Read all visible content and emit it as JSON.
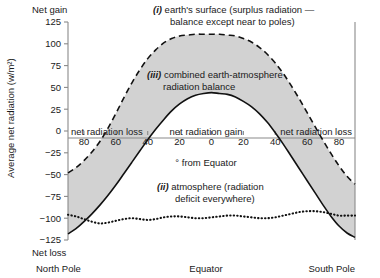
{
  "chart_data": {
    "type": "line",
    "title": "",
    "xlabel": "° from Equator",
    "ylabel": "Average net radiation (w/m²)",
    "ylim": [
      -125,
      125
    ],
    "yticks": [
      125,
      100,
      75,
      50,
      25,
      0,
      -25,
      -50,
      -75,
      -100,
      -125
    ],
    "ytick_labels": [
      "125",
      "100",
      "75",
      "50",
      "25",
      "0",
      "−25",
      "−50",
      "−75",
      "−100",
      "−125"
    ],
    "xlim": [
      -90,
      90
    ],
    "xticks": [
      -80,
      -60,
      -40,
      -20,
      0,
      20,
      40,
      60,
      80
    ],
    "xtick_labels": [
      "80",
      "60",
      "40",
      "20",
      "0",
      "20",
      "40",
      "60",
      "80"
    ],
    "x_left_end_label": "North Pole",
    "x_center_label": "Equator",
    "x_right_end_label": "South Pole",
    "y_top_label": "Net gain",
    "y_bottom_label": "Net loss",
    "grid": false,
    "legend_position": "inline-annotations",
    "x": [
      -90,
      -85,
      -80,
      -75,
      -70,
      -65,
      -60,
      -55,
      -50,
      -45,
      -40,
      -35,
      -30,
      -25,
      -20,
      -15,
      -10,
      -5,
      0,
      5,
      10,
      15,
      20,
      25,
      30,
      35,
      40,
      45,
      50,
      55,
      60,
      65,
      70,
      75,
      80,
      85,
      90
    ],
    "series": [
      {
        "name": "earth's surface",
        "key": "i",
        "style": "dashed",
        "values": [
          -48,
          -42,
          -34,
          -24,
          -12,
          3,
          20,
          38,
          55,
          70,
          83,
          93,
          101,
          106,
          109,
          110,
          111,
          111,
          111,
          111,
          110,
          109,
          106,
          102,
          96,
          88,
          78,
          66,
          52,
          37,
          21,
          5,
          -11,
          -26,
          -40,
          -52,
          -61
        ]
      },
      {
        "name": "combined earth-atmosphere radiation balance",
        "key": "iii",
        "style": "solid",
        "values": [
          -118,
          -112,
          -104,
          -95,
          -85,
          -74,
          -62,
          -49,
          -36,
          -23,
          -10,
          2,
          13,
          23,
          31,
          37,
          41,
          43,
          44,
          43,
          42,
          39,
          34,
          28,
          20,
          10,
          -2,
          -15,
          -29,
          -43,
          -57,
          -71,
          -85,
          -98,
          -109,
          -117,
          -122
        ]
      },
      {
        "name": "atmosphere (radiation deficit everywhere)",
        "key": "ii",
        "style": "dotted",
        "values": [
          -96,
          -98,
          -101,
          -104,
          -106,
          -105,
          -103,
          -101,
          -100,
          -101,
          -102,
          -101,
          -99,
          -98,
          -98,
          -99,
          -100,
          -100,
          -99,
          -98,
          -97,
          -97,
          -98,
          -99,
          -100,
          -100,
          -99,
          -97,
          -95,
          -93,
          -92,
          -92,
          -93,
          -95,
          -97,
          -97,
          -97
        ]
      }
    ],
    "annotations": [
      {
        "id": "ann-i",
        "text_line1": "(i) earth's surface (surplus radiation —",
        "text_line2": "balance except near to poles)",
        "italic_prefix": "(i)"
      },
      {
        "id": "ann-iii",
        "text_line1": "(iii) combined earth-atmosphere",
        "text_line2": "radiation balance",
        "italic_prefix": "(iii)"
      },
      {
        "id": "ann-ii",
        "text_line1": "(ii) atmosphere (radiation",
        "text_line2": "deficit everywhere)",
        "italic_prefix": "(ii)"
      }
    ],
    "zone_labels": [
      {
        "id": "zone-left",
        "text": "net radiation loss"
      },
      {
        "id": "zone-center",
        "text": "net radiation gain"
      },
      {
        "id": "zone-right",
        "text": "net radiation loss"
      }
    ],
    "colors": {
      "fill_between": "#d2d2d2",
      "line": "#111111",
      "axis": "#808080",
      "text": "#1a1a1a",
      "background": "#ffffff"
    }
  }
}
